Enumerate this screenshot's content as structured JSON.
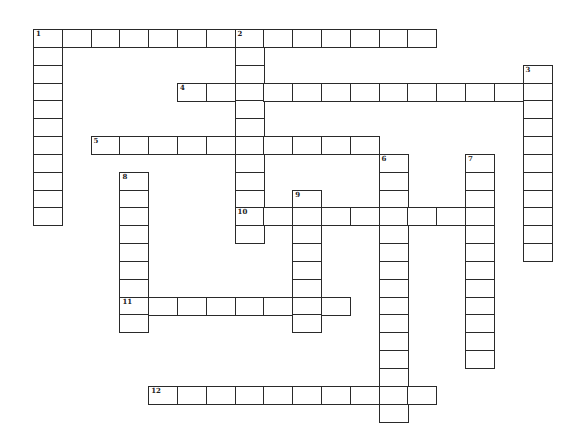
{
  "puzzle": {
    "type": "crossword",
    "grid": {
      "origin_x": 33,
      "origin_y": 29,
      "cell_width": 28.8,
      "cell_height": 17.84,
      "border_color": "#2a2a2a",
      "cell_color": "#ffffff"
    },
    "words": [
      {
        "number": "1",
        "direction": "across",
        "row": 0,
        "col": 0,
        "length": 14
      },
      {
        "number": "1",
        "direction": "down",
        "row": 0,
        "col": 0,
        "length": 11
      },
      {
        "number": "2",
        "direction": "down",
        "row": 0,
        "col": 7,
        "length": 12
      },
      {
        "number": "3",
        "direction": "down",
        "row": 2,
        "col": 17,
        "length": 11
      },
      {
        "number": "4",
        "direction": "across",
        "row": 3,
        "col": 5,
        "length": 13
      },
      {
        "number": "5",
        "direction": "across",
        "row": 6,
        "col": 2,
        "length": 10
      },
      {
        "number": "6",
        "direction": "down",
        "row": 7,
        "col": 12,
        "length": 15
      },
      {
        "number": "7",
        "direction": "down",
        "row": 7,
        "col": 15,
        "length": 12
      },
      {
        "number": "8",
        "direction": "down",
        "row": 8,
        "col": 3,
        "length": 9
      },
      {
        "number": "9",
        "direction": "down",
        "row": 9,
        "col": 9,
        "length": 8
      },
      {
        "number": "10",
        "direction": "across",
        "row": 10,
        "col": 7,
        "length": 9
      },
      {
        "number": "11",
        "direction": "across",
        "row": 15,
        "col": 3,
        "length": 8
      },
      {
        "number": "12",
        "direction": "across",
        "row": 20,
        "col": 4,
        "length": 10
      }
    ]
  }
}
